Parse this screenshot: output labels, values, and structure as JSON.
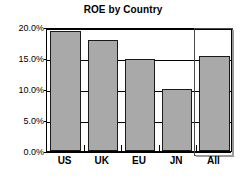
{
  "chart_data": {
    "type": "bar",
    "title": "ROE by Country",
    "xlabel": "",
    "ylabel": "",
    "categories": [
      "US",
      "UK",
      "EU",
      "JN",
      "All"
    ],
    "values": [
      19.4,
      17.9,
      14.8,
      10.0,
      15.4
    ],
    "value_labels": [
      "19.4%",
      "17.9%",
      "14.8%",
      "10.0%",
      "15.4%"
    ],
    "ylim": [
      0,
      20
    ],
    "ytick_values": [
      0,
      5,
      10,
      15,
      20
    ],
    "ytick_labels": [
      "0.0%",
      "5.0%",
      "10.0%",
      "15.0%",
      "20.0%"
    ],
    "grid": true,
    "legend": false,
    "legend_position": "none",
    "series": [
      {
        "name": "ROE",
        "values": [
          19.4,
          17.9,
          14.8,
          10.0,
          15.4
        ]
      }
    ],
    "annotations": [
      {
        "name": "highlight-box",
        "target_category": "All",
        "description": "white outlined selection rectangle spanning full plot height around the All bar"
      }
    ]
  },
  "colors": {
    "bar_fill": "#a9a9a9",
    "bar_border": "#1a1a1a",
    "axis": "#000000",
    "grid": "#000000",
    "background": "#ffffff",
    "highlight_border": "#4a4a4a",
    "highlight_shadow": "#9a9a9a"
  }
}
